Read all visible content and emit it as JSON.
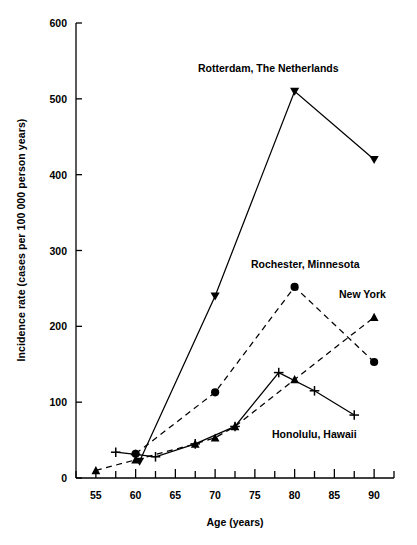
{
  "chart_data": {
    "type": "line",
    "title": "",
    "xlabel": "Age (years)",
    "ylabel": "Incidence rate (cases per 100 000 person years)",
    "xlim": [
      52.5,
      92.5
    ],
    "ylim": [
      0,
      600
    ],
    "xticks": [
      55,
      60,
      65,
      70,
      75,
      80,
      85,
      90
    ],
    "xtick_labels": [
      "55",
      "60",
      "65",
      "70",
      "75",
      "80",
      "85",
      "90"
    ],
    "xminor_step": 2.5,
    "yticks": [
      0,
      100,
      200,
      300,
      400,
      500,
      600
    ],
    "ytick_labels": [
      "0",
      "100",
      "200",
      "300",
      "400",
      "500",
      "600"
    ],
    "grid": false,
    "legend_position": "inline-annotations",
    "series": [
      {
        "name": "Rotterdam, The Netherlands",
        "marker": "triangle-down",
        "linestyle": "solid",
        "color": "#000000",
        "x": [
          60.5,
          70,
          80,
          90
        ],
        "y": [
          22,
          240,
          510,
          420
        ]
      },
      {
        "name": "Rochester, Minnesota",
        "marker": "circle",
        "linestyle": "dashed",
        "color": "#000000",
        "x": [
          60,
          70,
          80,
          90
        ],
        "y": [
          32,
          113,
          252,
          153
        ]
      },
      {
        "name": "New York",
        "marker": "triangle-up",
        "linestyle": "dashed",
        "color": "#000000",
        "x": [
          55,
          60,
          67.5,
          70,
          72.5,
          80,
          90
        ],
        "y": [
          10,
          24,
          45,
          53,
          68,
          130,
          212
        ]
      },
      {
        "name": "Honolulu, Hawaii",
        "marker": "plus",
        "linestyle": "solid",
        "color": "#000000",
        "x": [
          57.5,
          60,
          62.5,
          67.5,
          72.5,
          78,
          82.5,
          87.5
        ],
        "y": [
          34,
          31,
          28,
          45,
          68,
          139,
          115,
          83
        ]
      }
    ],
    "annotations": [
      {
        "text": "Rotterdam, The Netherlands",
        "series": "Rotterdam, The Netherlands"
      },
      {
        "text": "Rochester, Minnesota",
        "series": "Rochester, Minnesota"
      },
      {
        "text": "New York",
        "series": "New York"
      },
      {
        "text": "Honolulu, Hawaii",
        "series": "Honolulu, Hawaii"
      }
    ]
  }
}
